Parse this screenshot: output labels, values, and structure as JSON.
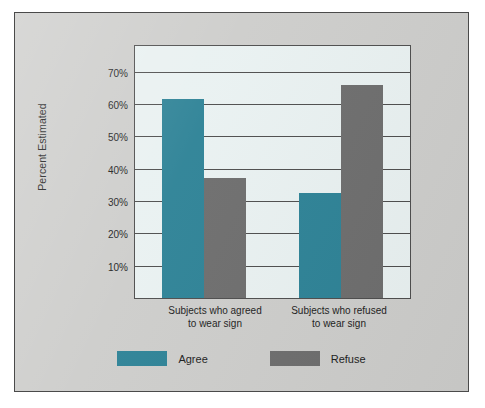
{
  "chart_data": {
    "type": "bar",
    "title": "",
    "subtitle": "",
    "xlabel": "",
    "ylabel": "Percent Estimated",
    "categories": [
      "Subjects who agreed\nto wear sign",
      "Subjects who refused\nto wear sign"
    ],
    "category_lines": [
      [
        "Subjects who agreed",
        "to wear sign"
      ],
      [
        "Subjects who refused",
        "to wear sign"
      ]
    ],
    "series": [
      {
        "name": "Agree",
        "color": "#2d8296",
        "values": [
          61.5,
          32.5
        ]
      },
      {
        "name": "Refuse",
        "color": "#6d6d6d",
        "values": [
          37.0,
          66.0
        ]
      }
    ],
    "ylim": [
      0,
      78
    ],
    "ytick_values": [
      10,
      20,
      30,
      40,
      50,
      60,
      70
    ],
    "ytick_labels": [
      "10%",
      "20%",
      "30%",
      "40%",
      "50%",
      "60%",
      "70%"
    ],
    "extra_gridline_values": [
      78
    ],
    "grid": true,
    "grid_axis": "y",
    "legend_position": "bottom",
    "legend": [
      {
        "label": "Agree",
        "color": "#2d8296"
      },
      {
        "label": "Refuse",
        "color": "#6d6d6d"
      }
    ],
    "plot_background": "#e9f1f1",
    "figure_background": "#cdcdcb",
    "axis_color": "#4d4d4d"
  }
}
